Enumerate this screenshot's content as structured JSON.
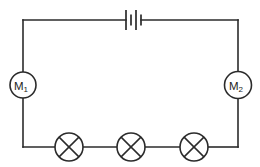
{
  "diagram": {
    "type": "electrical-circuit-schematic",
    "background_color": "#ffffff",
    "line_color": "#2b2b2b",
    "line_width": 1.6,
    "canvas": {
      "width": 260,
      "height": 167
    }
  },
  "circuit": {
    "loop": {
      "left_x": 23,
      "right_x": 238,
      "top_y": 20,
      "bottom_y": 147
    },
    "battery": {
      "name": "battery",
      "label": "",
      "center_x": 132,
      "center_y": 20,
      "plates": [
        {
          "kind": "long",
          "x": 126,
          "half_height": 10
        },
        {
          "kind": "short",
          "x": 131,
          "half_height": 5.5
        },
        {
          "kind": "long",
          "x": 136,
          "half_height": 10
        },
        {
          "kind": "short",
          "x": 141,
          "half_height": 5.5
        }
      ]
    },
    "meters": [
      {
        "name": "meter-m1",
        "label": "M",
        "subscript": "1",
        "center_x": 23,
        "center_y": 85,
        "radius": 13
      },
      {
        "name": "meter-m2",
        "label": "M",
        "subscript": "2",
        "center_x": 238,
        "center_y": 85,
        "radius": 13.5
      }
    ],
    "lamps": [
      {
        "name": "lamp-1",
        "center_x": 69,
        "center_y": 147,
        "radius": 14
      },
      {
        "name": "lamp-2",
        "center_x": 131,
        "center_y": 147,
        "radius": 14
      },
      {
        "name": "lamp-3",
        "center_x": 194,
        "center_y": 147,
        "radius": 14
      }
    ]
  }
}
